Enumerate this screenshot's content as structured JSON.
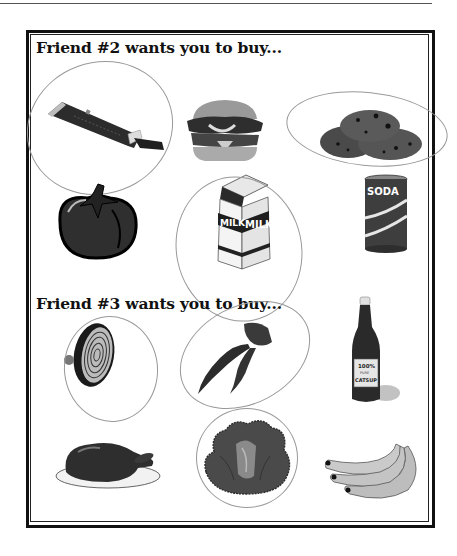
{
  "page": {
    "sections": [
      {
        "heading": "Friend #2 wants you to buy...",
        "items": [
          {
            "name": "chocolate bar",
            "circled": true
          },
          {
            "name": "hamburger",
            "circled": false
          },
          {
            "name": "cookies",
            "circled": true
          },
          {
            "name": "tomato",
            "circled": false
          },
          {
            "name": "milk carton",
            "circled": true,
            "label": "MILK"
          },
          {
            "name": "soda can",
            "circled": false,
            "label": "SODA"
          }
        ]
      },
      {
        "heading": "Friend #3 wants you to buy...",
        "items": [
          {
            "name": "onion",
            "circled": true
          },
          {
            "name": "chili peppers",
            "circled": true
          },
          {
            "name": "ketchup bottle",
            "circled": false,
            "label_top": "100%",
            "label_mid": "PURE",
            "label_bottom": "CATSUP"
          },
          {
            "name": "roast turkey",
            "circled": false
          },
          {
            "name": "lettuce",
            "circled": true
          },
          {
            "name": "bananas",
            "circled": false
          }
        ]
      }
    ]
  },
  "colors": {
    "ink": "#111111",
    "dark_fill": "#3a3a3a",
    "mid_fill": "#6a6a6a",
    "light_fill": "#bdbdbd",
    "circle_stroke": "#8a8a8a"
  }
}
